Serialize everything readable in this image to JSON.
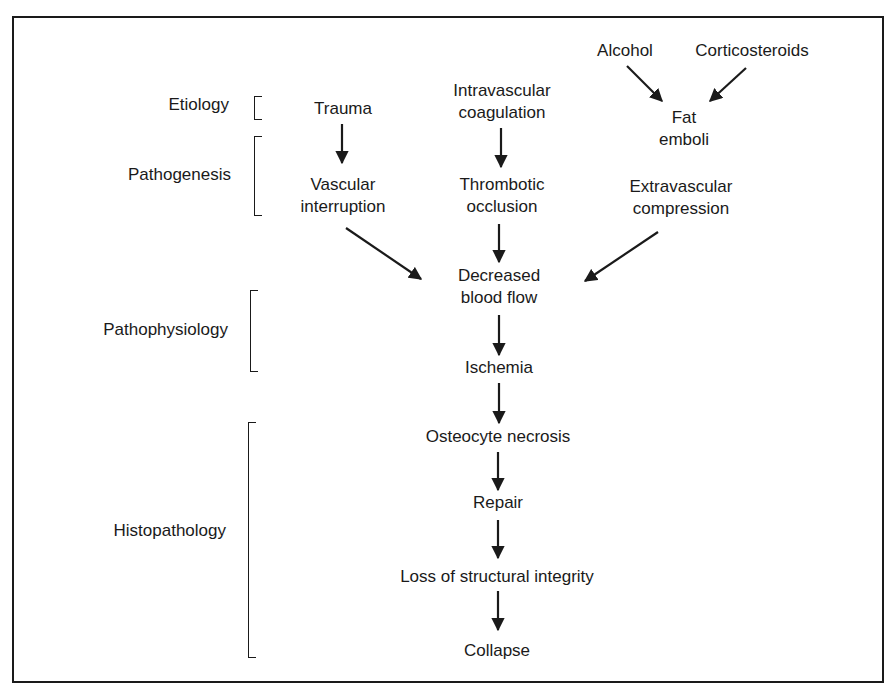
{
  "diagram": {
    "stages": [
      {
        "label": "Etiology"
      },
      {
        "label": "Pathogenesis"
      },
      {
        "label": "Pathophysiology"
      },
      {
        "label": "Histopathology"
      }
    ],
    "nodes": {
      "alcohol": "Alcohol",
      "corticosteroids": "Corticosteroids",
      "trauma": "Trauma",
      "intravascular_1": "Intravascular",
      "intravascular_2": "coagulation",
      "fat_1": "Fat",
      "fat_2": "emboli",
      "vascular_1": "Vascular",
      "vascular_2": "interruption",
      "thrombotic_1": "Thrombotic",
      "thrombotic_2": "occlusion",
      "extravascular_1": "Extravascular",
      "extravascular_2": "compression",
      "decreased_1": "Decreased",
      "decreased_2": "blood flow",
      "ischemia": "Ischemia",
      "osteocyte": "Osteocyte necrosis",
      "repair": "Repair",
      "loss": "Loss of structural integrity",
      "collapse": "Collapse"
    },
    "edges": [
      {
        "from": "Alcohol",
        "to": "Fat emboli"
      },
      {
        "from": "Corticosteroids",
        "to": "Fat emboli"
      },
      {
        "from": "Trauma",
        "to": "Vascular interruption"
      },
      {
        "from": "Intravascular coagulation",
        "to": "Thrombotic occlusion"
      },
      {
        "from": "Vascular interruption",
        "to": "Decreased blood flow"
      },
      {
        "from": "Thrombotic occlusion",
        "to": "Decreased blood flow"
      },
      {
        "from": "Extravascular compression",
        "to": "Decreased blood flow"
      },
      {
        "from": "Decreased blood flow",
        "to": "Ischemia"
      },
      {
        "from": "Ischemia",
        "to": "Osteocyte necrosis"
      },
      {
        "from": "Osteocyte necrosis",
        "to": "Repair"
      },
      {
        "from": "Repair",
        "to": "Loss of structural integrity"
      },
      {
        "from": "Loss of structural integrity",
        "to": "Collapse"
      }
    ]
  }
}
